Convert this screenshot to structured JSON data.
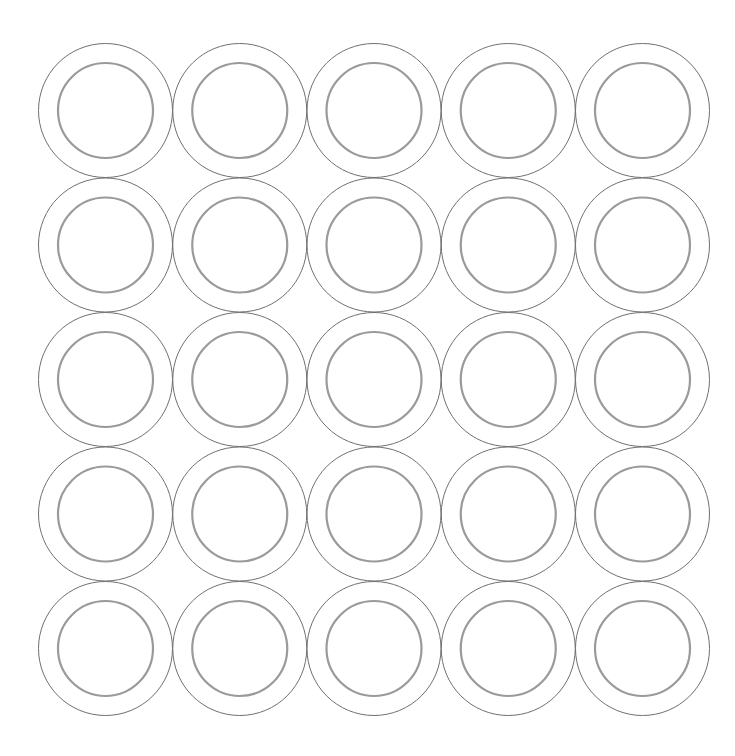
{
  "canvas": {
    "width": 735,
    "height": 756,
    "background": "#ffffff"
  },
  "grid": {
    "rows": 5,
    "cols": 5,
    "origin_x": 105.5,
    "origin_y": 110.5,
    "step_x": 134.25,
    "step_y": 134.5
  },
  "ring": {
    "outer_radius": 67,
    "outer_stroke": "#707070",
    "outer_stroke_width": 1,
    "inner_radius": 47.5,
    "inner_stroke": "#9a9a9a",
    "inner_stroke_width": 2.2
  }
}
